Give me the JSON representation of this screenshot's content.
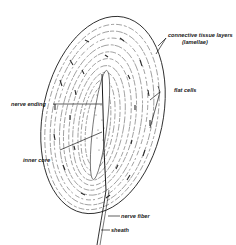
{
  "figure": {
    "labels": {
      "connective_tissue_layers": "connective tissue layers",
      "lamellae": "(lamellae)",
      "flat_cells": "flat cells",
      "nerve_ending": "nerve ending",
      "inner_core": "inner core",
      "nerve_fiber": "nerve fiber",
      "sheath": "sheath"
    },
    "colors": {
      "ink": "#1a1a1a",
      "background": "#ffffff"
    }
  }
}
